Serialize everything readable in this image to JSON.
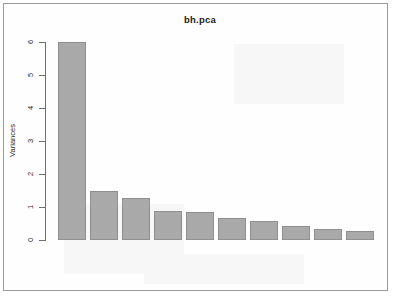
{
  "window": {
    "frame_border_color": "#9a9a9a",
    "background_color": "#ffffff"
  },
  "chart_data": {
    "type": "bar",
    "title": "bh.pca",
    "subtitle": "",
    "xlabel": "",
    "ylabel": "Variances",
    "categories": [
      "1",
      "2",
      "3",
      "4",
      "5",
      "6",
      "7",
      "8",
      "9",
      "10"
    ],
    "values": [
      6.01,
      1.47,
      1.26,
      0.88,
      0.85,
      0.68,
      0.57,
      0.43,
      0.33,
      0.27
    ],
    "ylim": [
      0,
      6.2
    ],
    "yticks": [
      "0",
      "1",
      "2",
      "3",
      "4",
      "5",
      "6"
    ],
    "ytick_values": [
      0,
      1,
      2,
      3,
      4,
      5,
      6
    ],
    "xticks": [],
    "grid": false,
    "legend": false,
    "legend_position": "none",
    "bar_fill_color": "#a9a9a9",
    "bar_border_color": "#8f8f8f",
    "axis_color": "#6e6e6e",
    "text_color": "#2a2a2a",
    "annotations": []
  }
}
